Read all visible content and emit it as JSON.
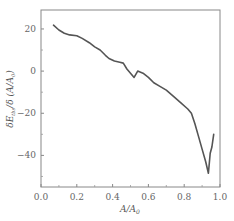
{
  "chart_data": {
    "type": "line",
    "title": "",
    "xlabel": "A/A0",
    "ylabel": "δE_tbs/δ(A/A0)",
    "xlim": [
      0.0,
      1.0
    ],
    "ylim": [
      -55,
      29
    ],
    "xticks": [
      0.0,
      0.2,
      0.4,
      0.6,
      0.8,
      1.0
    ],
    "xtick_labels": [
      "0.0",
      "0.2",
      "0.4",
      "0.6",
      "0.8",
      "1.0"
    ],
    "yticks": [
      20,
      0,
      -20,
      -40
    ],
    "ytick_labels": [
      "20",
      "0",
      "−20",
      "−40"
    ],
    "grid": false,
    "legend": null,
    "line_color": "#555555",
    "series": [
      {
        "name": "curve",
        "x": [
          0.07,
          0.1,
          0.13,
          0.16,
          0.2,
          0.23,
          0.27,
          0.3,
          0.33,
          0.36,
          0.38,
          0.41,
          0.44,
          0.46,
          0.48,
          0.5,
          0.52,
          0.54,
          0.57,
          0.6,
          0.63,
          0.66,
          0.7,
          0.74,
          0.78,
          0.82,
          0.84,
          0.86,
          0.88,
          0.9,
          0.92,
          0.935,
          0.945,
          0.955,
          0.965
        ],
        "values": [
          21.8,
          19.5,
          18.0,
          17.2,
          16.8,
          15.5,
          13.5,
          11.5,
          10.0,
          7.5,
          6.0,
          4.8,
          4.2,
          3.8,
          1.0,
          -1.0,
          -3.0,
          0.0,
          -1.0,
          -3.0,
          -5.5,
          -7.0,
          -9.0,
          -12.0,
          -15.0,
          -18.0,
          -20.0,
          -25.0,
          -31.0,
          -37.0,
          -43.0,
          -48.5,
          -39.0,
          -36.0,
          -30.0
        ]
      }
    ]
  },
  "labels": {
    "x_axis_main": "A/A",
    "x_axis_sub": "0",
    "y_axis_prefix": "δE",
    "y_axis_sub": "tbs",
    "y_axis_suffix": "/δ (A/A",
    "y_axis_sub2": "0",
    "y_axis_close": ")"
  }
}
